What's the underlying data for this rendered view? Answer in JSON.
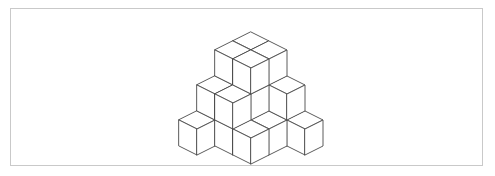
{
  "figure": {
    "frame": {
      "border_color": "#c9c9c9",
      "border_width": 1,
      "background_color": "#ffffff",
      "x": 10,
      "y": 8,
      "width": 473,
      "height": 158
    },
    "style": {
      "line_color": "#4a4a4a",
      "line_width": 0.9,
      "top_face_color": "#ffffff",
      "left_face_color": "#ffffff",
      "right_face_color": "#ffffff"
    },
    "projection": {
      "type": "isometric",
      "cube_half_width": 18,
      "cube_half_depth": 9,
      "cube_height": 26,
      "origin_x": 251,
      "origin_y": 110
    }
  },
  "chart_data": {
    "type": "scatter",
    "xlabel": "x (grid columns, right-depth axis)",
    "ylabel": "y (grid rows, left-depth axis)",
    "zlabel": "z (stack height in cubes)",
    "notation": "Each cube is placed on an integer lattice (x, y, z); x increases toward lower-right, y increases toward lower-left, z increases upward.",
    "grid": false,
    "legend": false,
    "xlim": [
      0,
      3
    ],
    "ylim": [
      0,
      3
    ],
    "zlim": [
      0,
      3
    ],
    "cube_count": 22,
    "levels": [
      {
        "z": 0,
        "label": "base layer",
        "count": 11
      },
      {
        "z": 1,
        "label": "middle layer",
        "count": 7
      },
      {
        "z": 2,
        "label": "top layer",
        "count": 4
      }
    ],
    "cubes": [
      {
        "x": 0,
        "y": 3,
        "z": 0
      },
      {
        "x": 0,
        "y": 2,
        "z": 0
      },
      {
        "x": 0,
        "y": 1,
        "z": 0
      },
      {
        "x": 0,
        "y": 0,
        "z": 0
      },
      {
        "x": 1,
        "y": 0,
        "z": 0
      },
      {
        "x": 2,
        "y": 0,
        "z": 0
      },
      {
        "x": 3,
        "y": 0,
        "z": 0
      },
      {
        "x": 1,
        "y": 1,
        "z": 0
      },
      {
        "x": 1,
        "y": 2,
        "z": 0
      },
      {
        "x": 2,
        "y": 1,
        "z": 0
      },
      {
        "x": 2,
        "y": 2,
        "z": 0
      },
      {
        "x": 0,
        "y": 2,
        "z": 1
      },
      {
        "x": 0,
        "y": 1,
        "z": 1
      },
      {
        "x": 0,
        "y": 0,
        "z": 1
      },
      {
        "x": 1,
        "y": 0,
        "z": 1
      },
      {
        "x": 2,
        "y": 0,
        "z": 1
      },
      {
        "x": 1,
        "y": 1,
        "z": 1
      },
      {
        "x": 1,
        "y": 2,
        "z": 1
      },
      {
        "x": 0,
        "y": 1,
        "z": 2
      },
      {
        "x": 0,
        "y": 0,
        "z": 2
      },
      {
        "x": 1,
        "y": 0,
        "z": 2
      },
      {
        "x": 1,
        "y": 1,
        "z": 2
      }
    ]
  }
}
